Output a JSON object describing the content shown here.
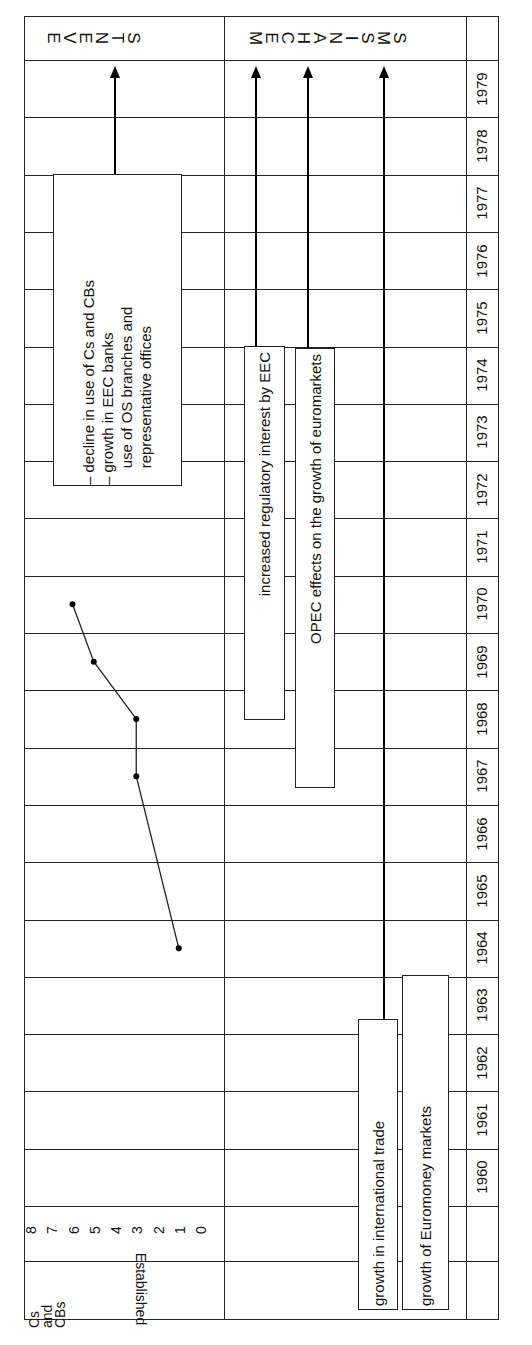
{
  "headers": {
    "events": "EVENTS",
    "mechanisms": "MECHANISMS"
  },
  "years": [
    "1979",
    "1978",
    "1977",
    "1976",
    "1975",
    "1974",
    "1973",
    "1972",
    "1971",
    "1970",
    "1969",
    "1968",
    "1967",
    "1966",
    "1965",
    "1964",
    "1963",
    "1962",
    "1961",
    "1960"
  ],
  "scale": {
    "digits": [
      "8",
      "7",
      "6",
      "5",
      "4",
      "3",
      "2",
      "1",
      "0"
    ]
  },
  "labels": {
    "cs_and_cbs": "Cs\nand\nCBs",
    "established": "Established"
  },
  "events_box": {
    "text": "– decline in use of Cs and CBs\n– growth in EEC banks\n    use of OS branches and\n    representative offices"
  },
  "mechanisms": [
    {
      "label": "increased regulatory interest by EEC",
      "start_year": "1968",
      "arrow_to": "1979+"
    },
    {
      "label": "OPEC effects on the growth of euromarkets",
      "start_year": "1967",
      "arrow_to": "1979+"
    },
    {
      "label": "growth in international trade",
      "start_year": "1962",
      "arrow_to": "1979+"
    },
    {
      "label": "growth of Euromoney markets",
      "start_year": "1963",
      "arrow_to": null
    }
  ],
  "chart_data": {
    "type": "line",
    "xlabel": "Year",
    "ylabel": "Cs and CBs Established",
    "ylim": [
      0,
      8
    ],
    "x": [
      1964,
      1967,
      1968,
      1969,
      1970
    ],
    "values": [
      1,
      3,
      3,
      5,
      6
    ],
    "categories_axis": [
      "1960",
      "1961",
      "1962",
      "1963",
      "1964",
      "1965",
      "1966",
      "1967",
      "1968",
      "1969",
      "1970",
      "1971",
      "1972",
      "1973",
      "1974",
      "1975",
      "1976",
      "1977",
      "1978",
      "1979"
    ],
    "grid": true,
    "orientation": "rotated 90° (years run bottom-to-top)"
  }
}
